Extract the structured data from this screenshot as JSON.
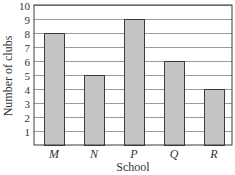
{
  "chart_data": {
    "type": "bar",
    "title": "",
    "xlabel": "School",
    "ylabel": "Number of clubs",
    "categories": [
      "M",
      "N",
      "P",
      "Q",
      "R"
    ],
    "values": [
      8,
      5,
      9,
      6,
      4
    ],
    "ylim": [
      0,
      10
    ],
    "yticks": [
      1,
      2,
      3,
      4,
      5,
      6,
      7,
      8,
      9,
      10
    ],
    "grid": true,
    "legend": null,
    "colors": {
      "bar_fill": "#c4c4c4",
      "bar_stroke": "#3a3a3a",
      "grid": "#9a9a9a",
      "frame": "#3a3a3a"
    }
  }
}
